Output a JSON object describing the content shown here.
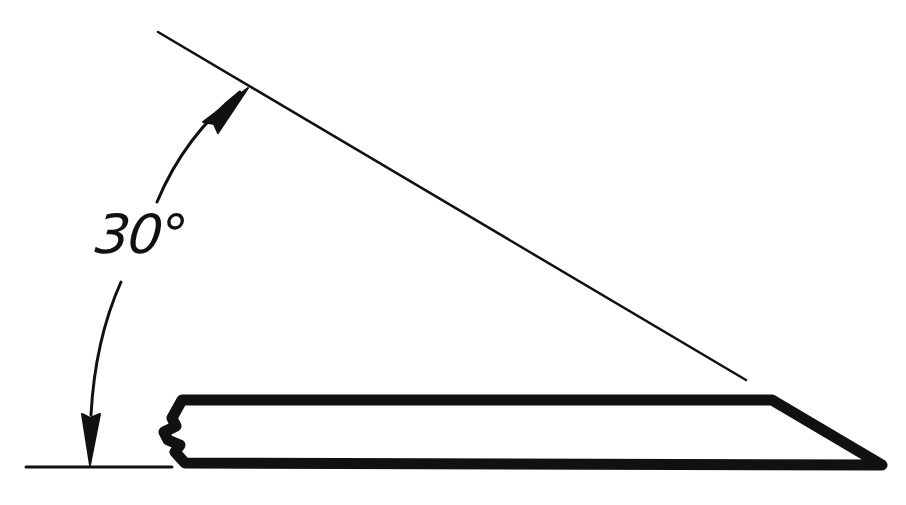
{
  "diagram": {
    "type": "technical sketch",
    "angle_label": "30°",
    "angle_value_degrees": 30,
    "colors": {
      "background": "#ffffff",
      "ink": "#111111"
    },
    "elements": {
      "baseline": "horizontal reference line",
      "inclined_line": "line at 30° to the horizontal",
      "angle_arc": "dimension arc with arrowheads at both ends",
      "strip": "thick-outlined flat bar with a bevelled right end and a broken left end"
    }
  }
}
